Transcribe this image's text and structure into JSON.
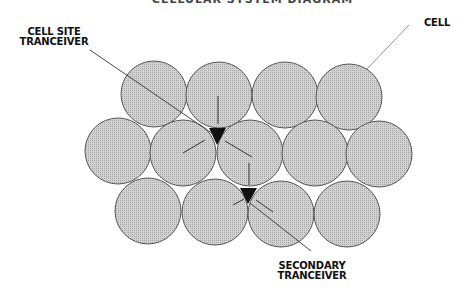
{
  "title": "CELLULAR SYSTEM DIAGRAM",
  "labels": {
    "cell": "CELL",
    "cell_site_line1": "CELL SITE",
    "cell_site_line2": "TRANCEIVER",
    "secondary_line1": "SECONDARY",
    "secondary_line2": "TRANCEIVER"
  },
  "colors": {
    "cell_fill": "#c8c8c8",
    "cell_stroke": "#555555",
    "tranceiver": "#111111",
    "background": "#ffffff"
  },
  "cells": {
    "radius": 33,
    "rows": [
      {
        "name": "top",
        "centers": [
          [
            154,
            94
          ],
          [
            219,
            95
          ],
          [
            285,
            95
          ],
          [
            349,
            97
          ]
        ]
      },
      {
        "name": "middle",
        "centers": [
          [
            118,
            151
          ],
          [
            183,
            153
          ],
          [
            250,
            153
          ],
          [
            315,
            153
          ],
          [
            379,
            154
          ]
        ]
      },
      {
        "name": "bottom",
        "centers": [
          [
            148,
            211
          ],
          [
            215,
            212
          ],
          [
            281,
            214
          ],
          [
            347,
            214
          ]
        ]
      }
    ]
  },
  "tranceivers": [
    {
      "name": "cell-site",
      "points": "209,128 226,128 217,145"
    },
    {
      "name": "secondary",
      "points": "240,188 257,188 248,204"
    }
  ]
}
